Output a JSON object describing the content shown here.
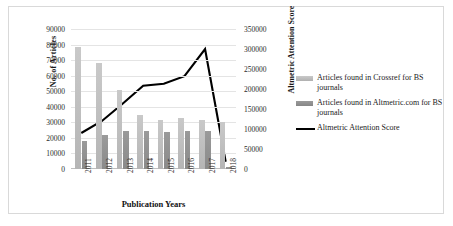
{
  "chart_data": {
    "type": "bar",
    "title": "",
    "xlabel": "Publication Years",
    "ylabel": "No. of Articles",
    "y2label": "Altmetric Attention Score",
    "grid": true,
    "legend_position": "right",
    "categories": [
      "2011",
      "2012",
      "2013",
      "2014",
      "2015",
      "2016",
      "2017",
      "2018"
    ],
    "ylim": [
      0,
      90000
    ],
    "y2lim": [
      0,
      350000
    ],
    "yticks": [
      "0",
      "10000",
      "20000",
      "30000",
      "40000",
      "50000",
      "60000",
      "70000",
      "80000",
      "90000"
    ],
    "y2ticks": [
      "0",
      "50000",
      "100000",
      "150000",
      "200000",
      "250000",
      "300000",
      "350000"
    ],
    "series": [
      {
        "name": "Articles found in Crossref for BS journals",
        "type": "bar",
        "axis": "left",
        "color": "#c2c2c2",
        "values": [
          78500,
          68000,
          51000,
          34700,
          31700,
          32600,
          31200,
          30500
        ]
      },
      {
        "name": "Articles found in Altmetric.com for BS journals",
        "type": "bar",
        "axis": "left",
        "color": "#909090",
        "values": [
          18000,
          21700,
          24500,
          24300,
          23800,
          24600,
          24700,
          1200
        ]
      },
      {
        "name": "Altmetric Attention Score",
        "type": "line",
        "axis": "right",
        "color": "#000000",
        "values": [
          90000,
          120000,
          163000,
          208000,
          213000,
          232000,
          300000,
          18000
        ]
      }
    ]
  },
  "legend": {
    "items": [
      {
        "label": "Articles found in Crossref for BS journals",
        "marker": "bar-swatch-light"
      },
      {
        "label": "Articles found in Altmetric.com for BS journals",
        "marker": "bar-swatch-dark"
      },
      {
        "label": "Altmetric Attention Score",
        "marker": "line-swatch-black"
      }
    ]
  }
}
